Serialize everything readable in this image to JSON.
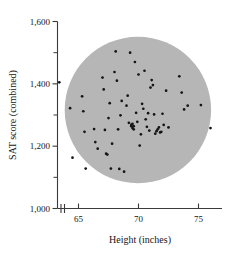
{
  "figure": {
    "name": "sat-score-vs-height-scatterplot",
    "background_color": "#ffffff",
    "point_color": "#141414",
    "blob_color": "#b6b6b6",
    "axis_color": "#3a3a3a"
  },
  "chart_data": {
    "type": "scatter",
    "title": "",
    "xlabel": "Height (inches)",
    "ylabel": "SAT score (combined)",
    "xlim": [
      63.2,
      76.6
    ],
    "ylim": [
      1000,
      1600
    ],
    "xticks": [
      65,
      70,
      75
    ],
    "xtick_labels": [
      "65",
      "70",
      "75"
    ],
    "yticks": [
      1000,
      1100,
      1200,
      1300,
      1400,
      1500,
      1600
    ],
    "ytick_labels_major": [
      "1,000",
      "1,200",
      "1,400",
      "1,600"
    ],
    "ymajor": [
      1000,
      1200,
      1400,
      1600
    ],
    "yminor": [
      1100,
      1300,
      1500
    ],
    "grid": false,
    "legend": null,
    "axis_break_x": true,
    "region": {
      "shape": "ellipse",
      "center_x": 69.95,
      "center_y": 1316,
      "radius_x": 6.1,
      "radius_y": 235,
      "color": "#b6b6b6",
      "note": "shaded elliptical region enclosing the cloud of points"
    },
    "x": [
      63.4,
      64.3,
      64.5,
      65.3,
      65.4,
      65.5,
      65.6,
      66.3,
      66.4,
      66.6,
      67.0,
      67.1,
      67.2,
      67.3,
      67.4,
      67.5,
      67.6,
      67.7,
      67.8,
      68.0,
      68.1,
      68.2,
      68.3,
      68.4,
      68.5,
      68.6,
      68.8,
      69.0,
      69.1,
      69.2,
      69.3,
      69.4,
      69.4,
      69.5,
      69.5,
      69.6,
      69.6,
      69.7,
      69.8,
      69.9,
      70.0,
      70.1,
      70.2,
      70.3,
      70.4,
      70.5,
      70.6,
      70.7,
      70.8,
      70.9,
      71.0,
      71.1,
      71.2,
      71.3,
      71.4,
      71.5,
      71.6,
      71.7,
      71.8,
      71.9,
      72.0,
      72.1,
      72.3,
      72.5,
      73.4,
      73.6,
      73.8,
      74.1,
      75.2,
      76.0
    ],
    "y": [
      1405,
      1322,
      1163,
      1360,
      1312,
      1246,
      1128,
      1255,
      1213,
      1192,
      1420,
      1382,
      1252,
      1176,
      1173,
      1290,
      1338,
      1128,
      1208,
      1438,
      1504,
      1410,
      1254,
      1127,
      1299,
      1345,
      1118,
      1330,
      1362,
      1275,
      1500,
      1264,
      1268,
      1258,
      1272,
      1254,
      1264,
      1470,
      1307,
      1278,
      1430,
      1202,
      1238,
      1336,
      1320,
      1442,
      1286,
      1262,
      1306,
      1250,
      1388,
      1412,
      1396,
      1302,
      1240,
      1248,
      1254,
      1260,
      1244,
      1246,
      1304,
      1268,
      1378,
      1260,
      1424,
      1372,
      1318,
      1330,
      1332,
      1258
    ]
  }
}
